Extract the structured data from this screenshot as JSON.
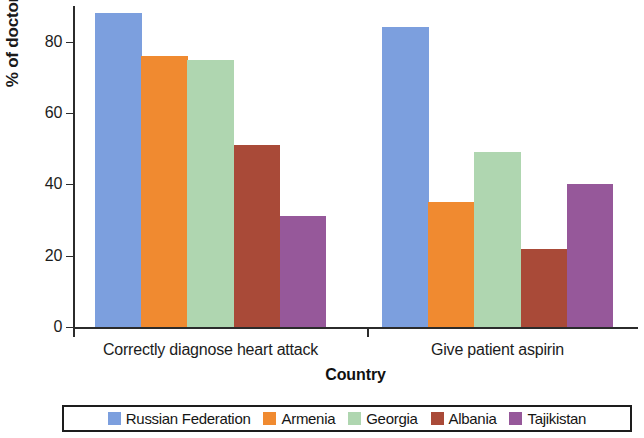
{
  "chart_data": {
    "type": "bar",
    "title": "",
    "xlabel": "Country",
    "ylabel": "% of doctors",
    "categories": [
      "Correctly diagnose heart attack",
      "Give patient aspirin"
    ],
    "ylim": [
      0,
      90
    ],
    "yticks": [
      0,
      20,
      40,
      60,
      80
    ],
    "ytick_labels": [
      "0",
      "20",
      "40",
      "60",
      "80"
    ],
    "grid": false,
    "legend_position": "bottom",
    "series": [
      {
        "name": "Russian Federation",
        "color": "#7C9FDE",
        "values": [
          88,
          84
        ]
      },
      {
        "name": "Armenia",
        "color": "#F08A30",
        "values": [
          76,
          35
        ]
      },
      {
        "name": "Georgia",
        "color": "#AFD6B0",
        "values": [
          75,
          49
        ]
      },
      {
        "name": "Albania",
        "color": "#A94A38",
        "values": [
          51,
          22
        ]
      },
      {
        "name": "Tajikistan",
        "color": "#96589A",
        "values": [
          31,
          40
        ]
      }
    ]
  }
}
